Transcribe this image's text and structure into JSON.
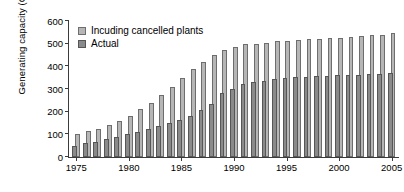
{
  "chart_data": {
    "type": "bar",
    "title": "",
    "xlabel": "",
    "ylabel": "Generating capacity (GW)",
    "ylim": [
      0,
      600
    ],
    "xlim": [
      1974.3,
      2005.7
    ],
    "grid": false,
    "legend_position": "top-left",
    "yticks": [
      0,
      100,
      200,
      300,
      400,
      500,
      600
    ],
    "xticks": [
      1975,
      1980,
      1985,
      1990,
      1995,
      2000,
      2005
    ],
    "categories": [
      1975,
      1976,
      1977,
      1978,
      1979,
      1980,
      1981,
      1982,
      1983,
      1984,
      1985,
      1986,
      1987,
      1988,
      1989,
      1990,
      1991,
      1992,
      1993,
      1994,
      1995,
      1996,
      1997,
      1998,
      1999,
      2000,
      2001,
      2002,
      2003,
      2004,
      2005
    ],
    "series": [
      {
        "name": "Incuding cancelled plants",
        "color": "#b6b6b6",
        "values": [
          103,
          113,
          123,
          140,
          160,
          183,
          212,
          240,
          272,
          307,
          347,
          387,
          418,
          450,
          470,
          487,
          497,
          500,
          505,
          510,
          512,
          517,
          520,
          522,
          525,
          527,
          530,
          535,
          538,
          540,
          548
        ]
      },
      {
        "name": "Actual",
        "color": "#8a8a8a",
        "values": [
          50,
          60,
          68,
          78,
          88,
          100,
          110,
          122,
          135,
          148,
          162,
          182,
          207,
          235,
          282,
          300,
          320,
          330,
          337,
          342,
          347,
          352,
          355,
          357,
          358,
          360,
          361,
          363,
          365,
          368,
          372
        ]
      }
    ]
  },
  "legend": {
    "items": [
      {
        "label": "Incuding cancelled plants",
        "swatch": "light"
      },
      {
        "label": "Actual",
        "swatch": "dark"
      }
    ]
  },
  "axis": {
    "y_title": "Generating capacity (GW)",
    "y_tick_labels": [
      "0",
      "100",
      "200",
      "300",
      "400",
      "500",
      "600"
    ],
    "x_tick_labels": [
      "1975",
      "1980",
      "1985",
      "1990",
      "1995",
      "2000",
      "2005"
    ]
  }
}
